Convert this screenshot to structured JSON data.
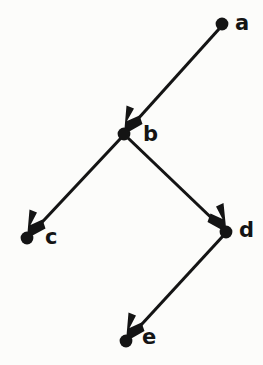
{
  "figure": {
    "kind": "directed-graph",
    "background_color": "#fcfcfa",
    "ink_color": "#141414",
    "width": 263,
    "height": 365
  },
  "graph": {
    "directed": true,
    "node_radius": 6,
    "edge_width": 3.1,
    "nodes": [
      {
        "id": "a",
        "label": "a",
        "x": 222,
        "y": 24,
        "label_x": 235,
        "label_y": 24
      },
      {
        "id": "b",
        "label": "b",
        "x": 124,
        "y": 134,
        "label_x": 143,
        "label_y": 135
      },
      {
        "id": "c",
        "label": "c",
        "x": 27,
        "y": 238,
        "label_x": 45,
        "label_y": 238
      },
      {
        "id": "d",
        "label": "d",
        "x": 226,
        "y": 232,
        "label_x": 239,
        "label_y": 231
      },
      {
        "id": "e",
        "label": "e",
        "x": 126,
        "y": 341,
        "label_x": 142,
        "label_y": 338
      }
    ],
    "edges": [
      {
        "id": "a-b",
        "source": "a",
        "target": "b",
        "label": "a to b"
      },
      {
        "id": "b-c",
        "source": "b",
        "target": "c",
        "label": "b to c"
      },
      {
        "id": "b-d",
        "source": "b",
        "target": "d",
        "label": "b to d"
      },
      {
        "id": "d-e",
        "source": "d",
        "target": "e",
        "label": "d to e"
      }
    ]
  }
}
